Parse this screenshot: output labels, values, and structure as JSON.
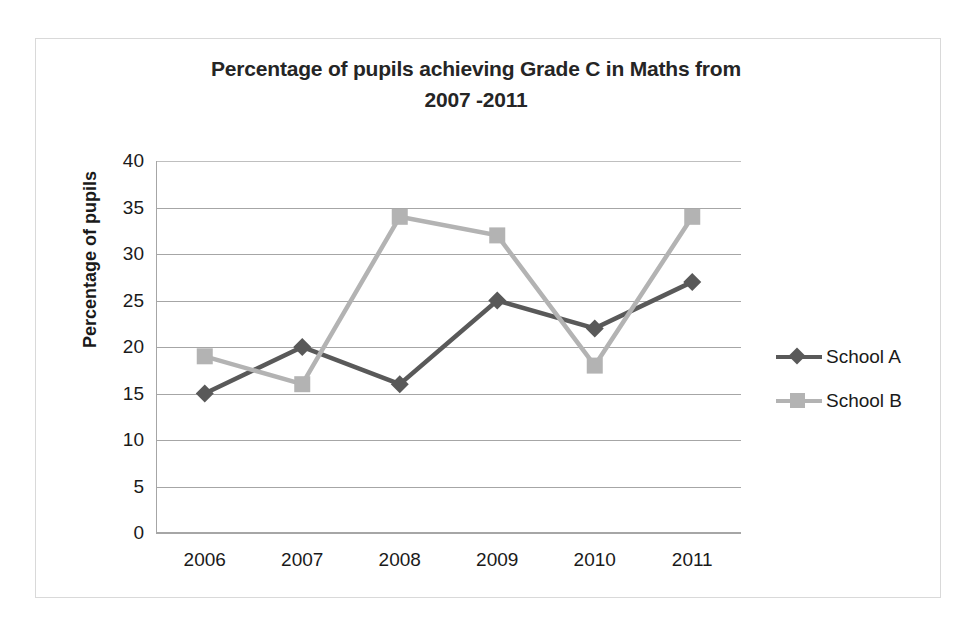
{
  "chart_data": {
    "type": "line",
    "title": "Percentage of pupils achieving Grade C in Maths from 2007 -2011",
    "title_line1": "Percentage of pupils achieving Grade C in Maths from",
    "title_line2": "2007 -2011",
    "xlabel": "",
    "ylabel": "Percentage of pupils",
    "categories": [
      "2006",
      "2007",
      "2008",
      "2009",
      "2010",
      "2011"
    ],
    "ylim": [
      0,
      40
    ],
    "ytick_step": 5,
    "yticks": [
      "40",
      "35",
      "30",
      "25",
      "20",
      "15",
      "10",
      "5",
      "0"
    ],
    "grid": true,
    "legend_position": "right",
    "series": [
      {
        "name": "School A",
        "values": [
          15,
          20,
          16,
          25,
          22,
          27
        ],
        "color": "#595959",
        "marker": "diamond"
      },
      {
        "name": "School B",
        "values": [
          19,
          16,
          34,
          32,
          18,
          34
        ],
        "color": "#b3b3b3",
        "marker": "square"
      }
    ]
  },
  "frame": {
    "border_color": "#d9d9d9",
    "background": "#ffffff"
  },
  "axis": {
    "line_color": "#a6a6a6",
    "grid_color": "#a6a6a6",
    "text_color": "#1a1a1a"
  }
}
